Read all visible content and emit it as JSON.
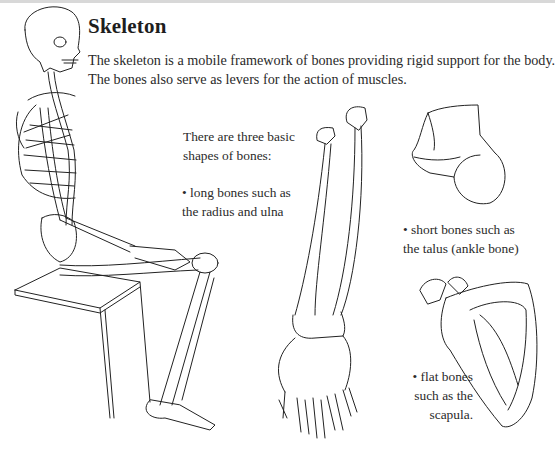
{
  "page": {
    "title": "Skeleton",
    "intro_line1": "The skeleton is a mobile framework of bones providing rigid support for the body.",
    "intro_line2": "The bones also serve as levers for the action of muscles."
  },
  "labels": {
    "shapes_intro_1": "There are three basic",
    "shapes_intro_2": "shapes of bones:",
    "long_1": "• long bones such as",
    "long_2": "the radius and ulna",
    "short_1": "• short bones such as",
    "short_2": "the talus (ankle bone)",
    "flat_1": "• flat bones",
    "flat_2": "such as the",
    "flat_3": "scapula."
  },
  "illustrations": [
    {
      "id": "seated-skeleton",
      "description": "Seated full human skeleton on a box"
    },
    {
      "id": "radius-ulna",
      "description": "Forearm bones radius and ulna with hand"
    },
    {
      "id": "talus",
      "description": "Talus ankle bone"
    },
    {
      "id": "scapula",
      "description": "Scapula shoulder blade"
    }
  ],
  "colors": {
    "line": "#222222",
    "text": "#2a2a2a",
    "topbar": "#d8d8d8"
  }
}
